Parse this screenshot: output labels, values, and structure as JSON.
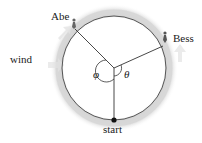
{
  "diagram": {
    "type": "circular-track",
    "labels": {
      "abe": "Abe",
      "bess": "Bess",
      "wind": "wind",
      "start": "start",
      "phi": "φ",
      "theta": "θ"
    },
    "colors": {
      "track_band": "#d9d9d9",
      "track_line": "#555555",
      "radius_line": "#333333",
      "text": "#1a1a1a"
    }
  }
}
